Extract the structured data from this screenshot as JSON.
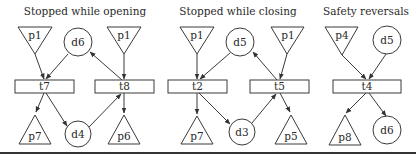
{
  "panels": [
    {
      "title": "Stopped while opening",
      "places": [
        {
          "id": "p1",
          "label": "p1",
          "shape": "triangle-down"
        },
        {
          "id": "d6",
          "label": "d6",
          "shape": "circle"
        },
        {
          "id": "p1b",
          "label": "p1",
          "shape": "triangle-down"
        },
        {
          "id": "p7",
          "label": "p7",
          "shape": "triangle-up"
        },
        {
          "id": "d4",
          "label": "d4",
          "shape": "circle"
        },
        {
          "id": "p6",
          "label": "p6",
          "shape": "triangle-up"
        }
      ],
      "transitions": [
        {
          "id": "t7",
          "label": "t7"
        },
        {
          "id": "t8",
          "label": "t8"
        }
      ],
      "arcs": [
        [
          "p1",
          "t7"
        ],
        [
          "d6",
          "t7"
        ],
        [
          "t7",
          "p7"
        ],
        [
          "t7",
          "d4"
        ],
        [
          "p1b",
          "t8"
        ],
        [
          "t8",
          "d6"
        ],
        [
          "d4",
          "t8"
        ],
        [
          "t8",
          "p6"
        ]
      ]
    },
    {
      "title": "Stopped while closing",
      "places": [
        {
          "id": "p1",
          "label": "p1",
          "shape": "triangle-down"
        },
        {
          "id": "d5",
          "label": "d5",
          "shape": "circle"
        },
        {
          "id": "p1b",
          "label": "p1",
          "shape": "triangle-down"
        },
        {
          "id": "p7",
          "label": "p7",
          "shape": "triangle-up"
        },
        {
          "id": "d3",
          "label": "d3",
          "shape": "circle"
        },
        {
          "id": "p5",
          "label": "p5",
          "shape": "triangle-up"
        }
      ],
      "transitions": [
        {
          "id": "t2",
          "label": "t2"
        },
        {
          "id": "t5",
          "label": "t5"
        }
      ],
      "arcs": [
        [
          "p1",
          "t2"
        ],
        [
          "d5",
          "t2"
        ],
        [
          "t2",
          "p7"
        ],
        [
          "t2",
          "d3"
        ],
        [
          "p1b",
          "t5"
        ],
        [
          "t5",
          "d5"
        ],
        [
          "d3",
          "t5"
        ],
        [
          "t5",
          "p5"
        ]
      ]
    },
    {
      "title": "Safety reversals",
      "places": [
        {
          "id": "p4",
          "label": "p4",
          "shape": "triangle-down"
        },
        {
          "id": "d5",
          "label": "d5",
          "shape": "circle"
        },
        {
          "id": "p8",
          "label": "p8",
          "shape": "triangle-up"
        },
        {
          "id": "d6",
          "label": "d6",
          "shape": "circle"
        }
      ],
      "transitions": [
        {
          "id": "t4",
          "label": "t4"
        }
      ],
      "arcs": [
        [
          "p4",
          "t4"
        ],
        [
          "d5",
          "t4"
        ],
        [
          "t4",
          "p8"
        ],
        [
          "t4",
          "d6"
        ]
      ]
    }
  ]
}
